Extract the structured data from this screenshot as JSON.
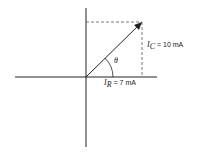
{
  "diagram": {
    "type": "phasor",
    "theta_label": "θ",
    "ic": {
      "symbol": "I",
      "sub": "C",
      "value": "= 10 mA"
    },
    "ir": {
      "symbol": "I",
      "sub": "R",
      "value": "= 7 mA"
    },
    "line_color": "#222222"
  }
}
